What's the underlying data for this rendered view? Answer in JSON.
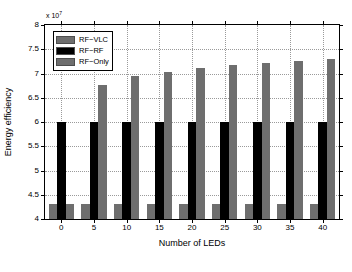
{
  "chart_data": {
    "type": "bar",
    "title": "",
    "xlabel": "Number of LEDs",
    "ylabel": "Energy efficiency",
    "exponent_label": "x 10",
    "exponent_power": "7",
    "grid": true,
    "legend_position": "upper-left-inside",
    "categories": [
      "0",
      "5",
      "10",
      "15",
      "20",
      "25",
      "30",
      "35",
      "40"
    ],
    "xlim": [
      -2.5,
      42.5
    ],
    "ylim": [
      4,
      8
    ],
    "ytick_labels": [
      "4",
      "4.5",
      "5",
      "5.5",
      "6",
      "6.5",
      "7",
      "7.5",
      "8"
    ],
    "ytick_values": [
      4,
      4.5,
      5,
      5.5,
      6,
      6.5,
      7,
      7.5,
      8
    ],
    "xtick_labels": [
      "0",
      "5",
      "10",
      "15",
      "20",
      "25",
      "30",
      "35",
      "40"
    ],
    "xtick_values": [
      0,
      5,
      10,
      15,
      20,
      25,
      30,
      35,
      40
    ],
    "series": [
      {
        "name": "RF-VLC",
        "color": "#6e6e6e",
        "values": [
          4.3,
          4.3,
          4.3,
          4.3,
          4.3,
          4.3,
          4.3,
          4.3,
          4.3
        ]
      },
      {
        "name": "RF-RF",
        "color": "#000000",
        "values": [
          6.01,
          6.01,
          6.01,
          6.01,
          6.01,
          6.01,
          6.01,
          6.01,
          6.01
        ]
      },
      {
        "name": "RF-Only",
        "color": "#6e6e6e",
        "values": [
          4.3,
          6.77,
          6.95,
          7.04,
          7.11,
          7.17,
          7.22,
          7.26,
          7.3
        ]
      }
    ]
  },
  "legend": {
    "entries": [
      {
        "label": "RF−VLC",
        "color": "#6e6e6e"
      },
      {
        "label": "RF−RF",
        "color": "#000000"
      },
      {
        "label": "RF−Only",
        "color": "#6e6e6e"
      }
    ]
  }
}
